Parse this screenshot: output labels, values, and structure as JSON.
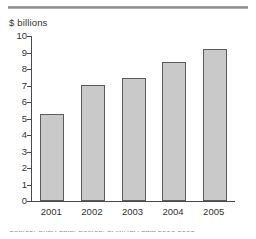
{
  "figure": {
    "unit_label": "$ billions",
    "bottom_caption": "Source: Chart data. Source: SAMHSA data 2001-2005"
  },
  "chart_data": {
    "type": "bar",
    "title": "",
    "subtitle": "",
    "xlabel": "",
    "ylabel": "$ billions",
    "categories": [
      "2001",
      "2002",
      "2003",
      "2004",
      "2005"
    ],
    "values": [
      5.3,
      7.05,
      7.45,
      8.4,
      9.2
    ],
    "ylim": [
      0,
      10
    ],
    "ytick_labels": [
      "0",
      "1",
      "2",
      "3",
      "4",
      "5",
      "6",
      "7",
      "8",
      "9",
      "10"
    ],
    "ytick_values": [
      0,
      1,
      2,
      3,
      4,
      5,
      6,
      7,
      8,
      9,
      10
    ],
    "grid": false,
    "legend": "none",
    "bar_fill_color": "#c9c9c9",
    "bar_border_color": "#5c5c5c",
    "axis_color": "#4a4a4a",
    "text_color": "#333333"
  }
}
